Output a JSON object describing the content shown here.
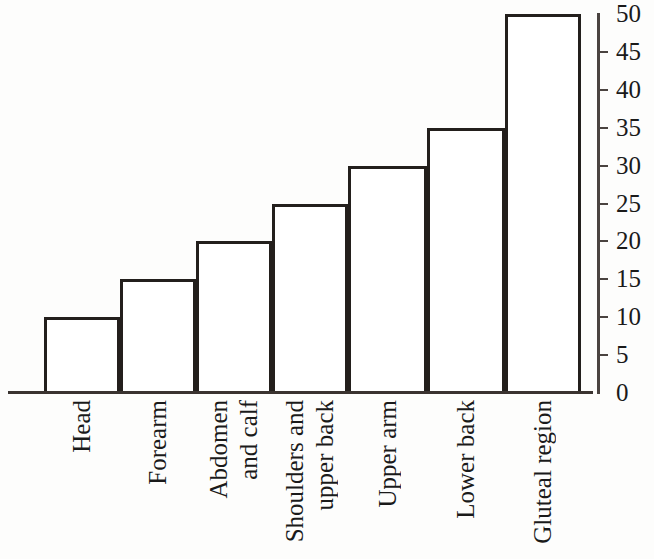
{
  "chart_data": {
    "type": "bar",
    "title": "",
    "subtitle": "",
    "xlabel": "",
    "ylabel": "",
    "categories": [
      "Head",
      "Forearm",
      "Abdomen and calf",
      "Shoulders and upper back",
      "Upper arm",
      "Lower back",
      "Gluteal region"
    ],
    "category_lines": [
      [
        "Head"
      ],
      [
        "Forearm"
      ],
      [
        "Abdomen",
        "and calf"
      ],
      [
        "Shoulders and",
        "upper back"
      ],
      [
        "Upper arm"
      ],
      [
        "Lower back"
      ],
      [
        "Gluteal region"
      ]
    ],
    "values": [
      10,
      15,
      20,
      25,
      30,
      35,
      50
    ],
    "ylim": [
      0,
      50
    ],
    "yticks": [
      0,
      5,
      10,
      15,
      20,
      25,
      30,
      35,
      40,
      45,
      50
    ],
    "ytick_labels": [
      "0",
      "5",
      "10",
      "15",
      "20",
      "25",
      "30",
      "35",
      "40",
      "45",
      "50"
    ],
    "grid": false,
    "legend": null,
    "legend_position": "none",
    "axis_position": "right",
    "bar_style": "outline",
    "bar_fill_color": "#ffffff",
    "bar_edge_color": "#231f1c",
    "axis_color": "#3a3330",
    "text_color": "#1a1a1a",
    "background_color": "#fdfdfc",
    "annotations": []
  }
}
